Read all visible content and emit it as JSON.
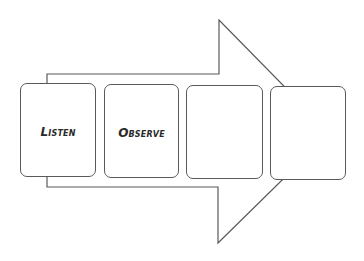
{
  "diagram": {
    "type": "process-arrow",
    "arrow": {
      "direction": "right",
      "stroke_color": "#5a5a5a",
      "fill_color": "#ffffff"
    },
    "steps": [
      {
        "label": "Listen"
      },
      {
        "label": "Observe"
      },
      {
        "label": ""
      },
      {
        "label": ""
      }
    ]
  }
}
